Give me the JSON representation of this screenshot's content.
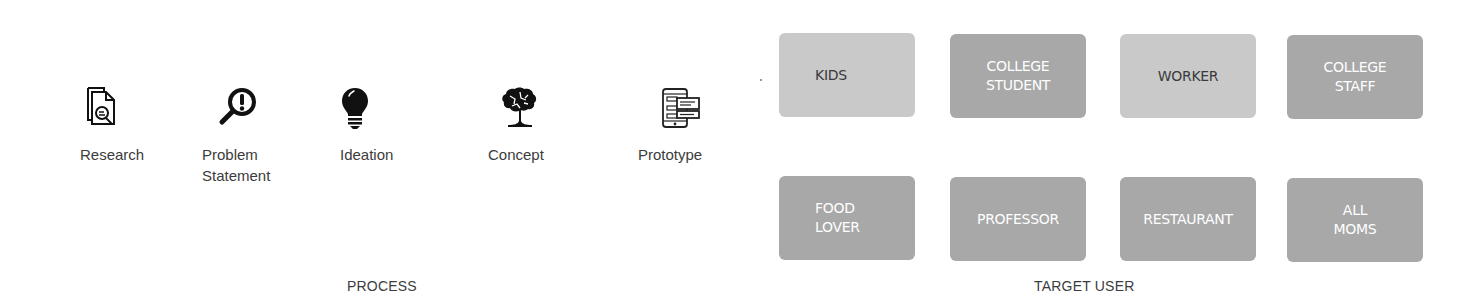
{
  "process": {
    "title": "PROCESS",
    "steps": [
      {
        "label": "Research",
        "icon": "document-search-icon"
      },
      {
        "label": "Problem\nStatement",
        "icon": "magnifier-exclamation-icon"
      },
      {
        "label": "Ideation",
        "icon": "lightbulb-icon"
      },
      {
        "label": "Concept",
        "icon": "brain-tree-icon"
      },
      {
        "label": "Prototype",
        "icon": "mobile-wireframe-icon"
      }
    ]
  },
  "target_user": {
    "title": "TARGET USER",
    "users": [
      {
        "label": "KIDS",
        "style": "light"
      },
      {
        "label": "COLLEGE\nSTUDENT",
        "style": "dark"
      },
      {
        "label": "WORKER",
        "style": "light"
      },
      {
        "label": "COLLEGE\nSTAFF",
        "style": "dark"
      },
      {
        "label": "FOOD\nLOVER",
        "style": "dark"
      },
      {
        "label": "PROFESSOR",
        "style": "dark"
      },
      {
        "label": "RESTAURANT",
        "style": "dark"
      },
      {
        "label": "ALL\nMOMS",
        "style": "dark"
      }
    ]
  },
  "colors": {
    "light_box": "#c9c9c9",
    "dark_box": "#a8a8a8",
    "light_box_text": "#3a3a3a",
    "dark_box_text": "#ffffff",
    "label_text": "#3c3c3c"
  }
}
